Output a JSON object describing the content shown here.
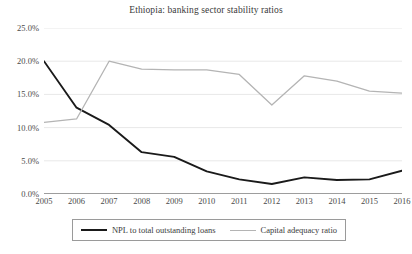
{
  "chart_data": {
    "type": "line",
    "title": "Ethiopia: banking sector stability ratios",
    "xlabel": "",
    "ylabel": "",
    "categories": [
      "2005",
      "2006",
      "2007",
      "2008",
      "2009",
      "2010",
      "2011",
      "2012",
      "2013",
      "2014",
      "2015",
      "2016"
    ],
    "ylim": [
      0,
      25
    ],
    "ytick_labels": [
      "0.0%",
      "5.0%",
      "10.0%",
      "15.0%",
      "20.0%",
      "25.0%"
    ],
    "ytick_values": [
      0,
      5,
      10,
      15,
      20,
      25
    ],
    "grid": true,
    "legend_position": "bottom",
    "series": [
      {
        "name": "NPL to total outstanding loans",
        "color": "#1a1a1a",
        "values": [
          20.0,
          13.0,
          10.4,
          6.3,
          5.6,
          3.4,
          2.2,
          1.5,
          2.5,
          2.1,
          2.2,
          3.5
        ]
      },
      {
        "name": "Capital adequacy ratio",
        "color": "#b4b4b4",
        "values": [
          10.8,
          11.3,
          20.0,
          18.8,
          18.7,
          18.7,
          18.0,
          13.4,
          17.8,
          17.0,
          15.5,
          15.2
        ]
      }
    ]
  },
  "legend": {
    "entries": [
      {
        "label": "NPL to total outstanding loans"
      },
      {
        "label": "Capital adequacy ratio"
      }
    ]
  }
}
